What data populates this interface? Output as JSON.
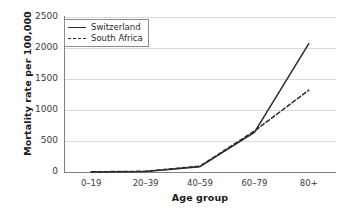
{
  "chart_data": {
    "type": "line",
    "title": "",
    "xlabel": "Age group",
    "ylabel": "Mortality rate per 100,000",
    "categories": [
      "0–19",
      "20–39",
      "40–59",
      "60–79",
      "80+"
    ],
    "series": [
      {
        "name": "Switzerland",
        "style": "solid",
        "color": "#2b2b2b",
        "values": [
          2,
          8,
          85,
          640,
          2070
        ]
      },
      {
        "name": "South Africa",
        "style": "dashed",
        "color": "#2b2b2b",
        "values": [
          3,
          12,
          95,
          660,
          1320
        ]
      }
    ],
    "ylim": [
      0,
      2500
    ],
    "yticks": [
      0,
      500,
      1000,
      1500,
      2000,
      2500
    ],
    "ytick_labels": [
      "0",
      "500",
      "1000",
      "1500",
      "2000",
      "2500"
    ],
    "grid": true,
    "legend_position": "upper left",
    "background_color": "#ffffff",
    "gridline_color": "#d9d9d9",
    "axis_color": "#808080"
  },
  "legend": {
    "entries": [
      {
        "label": "Switzerland"
      },
      {
        "label": "South Africa"
      }
    ]
  }
}
